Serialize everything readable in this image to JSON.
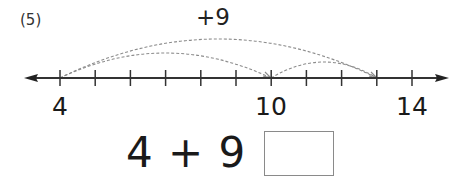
{
  "problem": {
    "number_label": "(5)",
    "jump_label": "+9"
  },
  "number_line": {
    "start_value": 4,
    "end_value": 14,
    "labels": [
      {
        "value": "4",
        "x": 60
      },
      {
        "value": "10",
        "x": 271
      },
      {
        "value": "14",
        "x": 412
      }
    ],
    "ticks": [
      4,
      5,
      6,
      7,
      8,
      9,
      10,
      11,
      12,
      13,
      14
    ],
    "arcs": [
      {
        "from": 4,
        "to": 13,
        "label": "+9"
      },
      {
        "from": 4,
        "to": 10
      },
      {
        "from": 10,
        "to": 13
      }
    ],
    "colors": {
      "axis": "#333333",
      "arc": "#8c8c8c"
    }
  },
  "equation": {
    "text": "4 + 9 =",
    "answer": ""
  }
}
